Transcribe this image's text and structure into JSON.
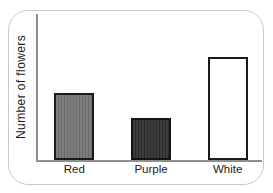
{
  "chart_data": {
    "type": "bar",
    "title": "",
    "xlabel": "",
    "ylabel": "Number of flowers",
    "categories": [
      "Red",
      "Purple",
      "White"
    ],
    "values": [
      65,
      41,
      100
    ],
    "ylim": [
      0,
      142
    ],
    "grid": false,
    "legend": "none",
    "axis_color": "#8f8f8f",
    "bars": [
      {
        "label": "Red",
        "value": 65,
        "fill": "#7e7e7e",
        "stripe": "#6a6a6a",
        "border": "#1a1a1a"
      },
      {
        "label": "Purple",
        "value": 41,
        "fill": "#3d3d3d",
        "stripe": "#2a2a2a",
        "border": "#141414"
      },
      {
        "label": "White",
        "value": 100,
        "fill": "#ffffff",
        "stripe": null,
        "border": "#1a1a1a"
      }
    ]
  },
  "card": {
    "background": "#ffffff",
    "border_color": "#c9c9c9"
  }
}
